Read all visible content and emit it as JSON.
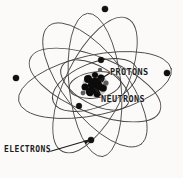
{
  "figure": {
    "background_color": "#fbfaf8",
    "ink_color": "#1c1c1c",
    "orbit_color": "#4a4a4a",
    "width": 183,
    "height": 178
  },
  "labels": {
    "protons": "PROTONS",
    "neutrons": "NEUTRONS",
    "electrons": "ELECTRONS"
  },
  "nucleus": {
    "center_x": 95,
    "center_y": 85,
    "radius": 13,
    "description": "dense cluster of protons and neutrons"
  },
  "electrons": [
    {
      "id": "electron-top",
      "x": 105,
      "y": 9,
      "r": 3.1
    },
    {
      "id": "electron-left",
      "x": 16,
      "y": 78,
      "r": 3.1
    },
    {
      "id": "electron-right",
      "x": 167,
      "y": 73,
      "r": 3.1
    },
    {
      "id": "electron-inner-top",
      "x": 101,
      "y": 60,
      "r": 2.9
    },
    {
      "id": "electron-inner-left",
      "x": 79,
      "y": 106,
      "r": 2.9
    },
    {
      "id": "electron-bottom",
      "x": 91,
      "y": 140,
      "r": 3.1
    }
  ],
  "orbits": [
    {
      "id": "orbit-1",
      "rx": 78,
      "ry": 30,
      "rotation": -12
    },
    {
      "id": "orbit-2",
      "rx": 75,
      "ry": 31,
      "rotation": 52
    },
    {
      "id": "orbit-3",
      "rx": 74,
      "ry": 30,
      "rotation": 116
    },
    {
      "id": "orbit-4",
      "rx": 72,
      "ry": 26,
      "rotation": 84
    },
    {
      "id": "orbit-5",
      "rx": 70,
      "ry": 28,
      "rotation": 22
    },
    {
      "id": "orbit-6",
      "rx": 45,
      "ry": 22,
      "rotation": -22
    },
    {
      "id": "orbit-7",
      "rx": 38,
      "ry": 19,
      "rotation": 30
    },
    {
      "id": "orbit-8",
      "rx": 26,
      "ry": 13,
      "rotation": -8
    }
  ],
  "leaders": [
    {
      "id": "leader-protons",
      "from_x": 110,
      "from_y": 73,
      "to_x": 99,
      "to_y": 80
    },
    {
      "id": "leader-neutrons",
      "from_x": 103,
      "from_y": 97,
      "to_x": 94,
      "to_y": 88
    },
    {
      "id": "leader-electrons",
      "from_x": 48,
      "from_y": 152,
      "to_x": 89,
      "to_y": 140
    }
  ]
}
